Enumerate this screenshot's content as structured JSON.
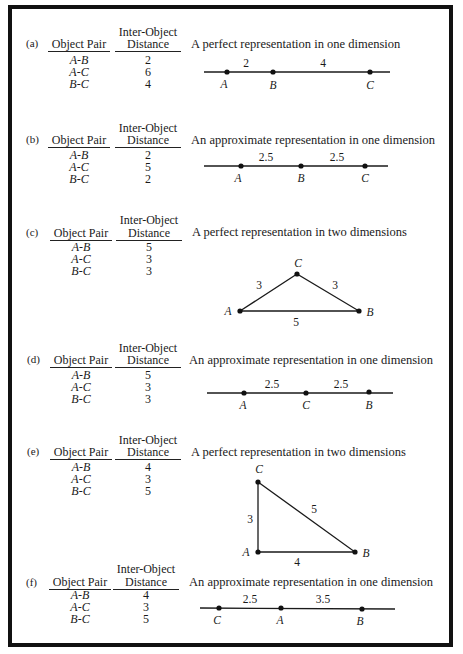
{
  "headers": {
    "object_pair": "Object Pair",
    "distance_line1": "Inter-Object",
    "distance_line2": "Distance"
  },
  "panels": [
    {
      "label": "(a)",
      "title": "A perfect representation in one dimension",
      "rows": [
        {
          "pair": "A-B",
          "distance": "2"
        },
        {
          "pair": "A-C",
          "distance": "6"
        },
        {
          "pair": "B-C",
          "distance": "4"
        }
      ],
      "diagram": {
        "type": "line",
        "points": [
          "A",
          "B",
          "C"
        ],
        "segments": [
          "2",
          "4"
        ]
      }
    },
    {
      "label": "(b)",
      "title": "An approximate representation in one dimension",
      "rows": [
        {
          "pair": "A-B",
          "distance": "2"
        },
        {
          "pair": "A-C",
          "distance": "5"
        },
        {
          "pair": "B-C",
          "distance": "2"
        }
      ],
      "diagram": {
        "type": "line",
        "points": [
          "A",
          "B",
          "C"
        ],
        "segments": [
          "2.5",
          "2.5"
        ]
      }
    },
    {
      "label": "(c)",
      "title": "A perfect representation in two dimensions",
      "rows": [
        {
          "pair": "A-B",
          "distance": "5"
        },
        {
          "pair": "A-C",
          "distance": "3"
        },
        {
          "pair": "B-C",
          "distance": "3"
        }
      ],
      "diagram": {
        "type": "triangle",
        "points": [
          "A",
          "B",
          "C"
        ],
        "edges": {
          "AC": "3",
          "CB": "3",
          "AB": "5"
        }
      }
    },
    {
      "label": "(d)",
      "title": "An approximate representation in one dimension",
      "rows": [
        {
          "pair": "A-B",
          "distance": "5"
        },
        {
          "pair": "A-C",
          "distance": "3"
        },
        {
          "pair": "B-C",
          "distance": "3"
        }
      ],
      "diagram": {
        "type": "line",
        "points": [
          "A",
          "C",
          "B"
        ],
        "segments": [
          "2.5",
          "2.5"
        ]
      }
    },
    {
      "label": "(e)",
      "title": "A perfect representation in two dimensions",
      "rows": [
        {
          "pair": "A-B",
          "distance": "4"
        },
        {
          "pair": "A-C",
          "distance": "3"
        },
        {
          "pair": "B-C",
          "distance": "5"
        }
      ],
      "diagram": {
        "type": "triangle",
        "points": [
          "A",
          "B",
          "C"
        ],
        "edges": {
          "AC": "3",
          "CB": "5",
          "AB": "4"
        }
      }
    },
    {
      "label": "(f)",
      "title": "An approximate representation in one dimension",
      "rows": [
        {
          "pair": "A-B",
          "distance": "4"
        },
        {
          "pair": "A-C",
          "distance": "3"
        },
        {
          "pair": "B-C",
          "distance": "5"
        }
      ],
      "diagram": {
        "type": "line",
        "points": [
          "C",
          "A",
          "B"
        ],
        "segments": [
          "2.5",
          "3.5"
        ]
      }
    }
  ]
}
